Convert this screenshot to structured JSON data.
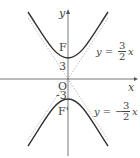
{
  "diagram": {
    "axes": {
      "x_label": "x",
      "y_label": "y",
      "origin_label": "O"
    },
    "labels": {
      "focus_upper": "F",
      "focus_lower": "F'",
      "vertex_upper": "3",
      "vertex_lower": "-3"
    },
    "asymptotes": [
      {
        "prefix": "y =",
        "sign": "",
        "num": "3",
        "den": "2",
        "var": "x"
      },
      {
        "prefix": "y =",
        "sign": "−",
        "num": "3",
        "den": "2",
        "var": "x"
      }
    ],
    "colors": {
      "curve": "#333333",
      "axis": "#555555",
      "asymptote": "#aaaaaa"
    }
  }
}
